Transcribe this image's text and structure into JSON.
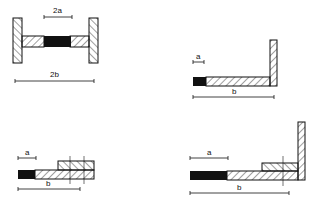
{
  "figures": [
    {
      "id": "fig-1",
      "shape": "I-section",
      "dims": {
        "inner": "2a",
        "outer": "2b"
      }
    },
    {
      "id": "fig-2",
      "shape": "L-section",
      "dims": {
        "inner": "a",
        "outer": "b"
      }
    },
    {
      "id": "fig-3",
      "shape": "stepped-bar",
      "dims": {
        "inner": "a",
        "outer": "b"
      }
    },
    {
      "id": "fig-4",
      "shape": "stepped-L-section",
      "dims": {
        "inner": "a",
        "outer": "b"
      }
    }
  ],
  "colors": {
    "line": "#111111",
    "fill_solid": "#111111",
    "background": "#ffffff"
  }
}
